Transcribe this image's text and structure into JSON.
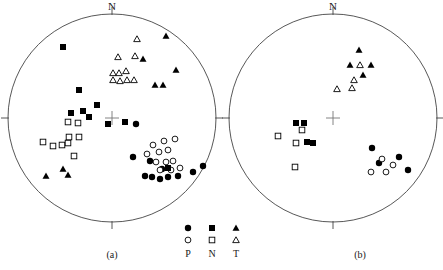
{
  "figure": {
    "background_color": "#ffffff",
    "stroke_color": "#444444",
    "marker_color": "#000000",
    "width": 443,
    "height": 270
  },
  "panels": [
    {
      "id": "a",
      "caption": "(a)",
      "north_label": "N",
      "cx": 112,
      "cy": 118,
      "r": 104
    },
    {
      "id": "b",
      "caption": "(b)",
      "north_label": "N",
      "cx": 333,
      "cy": 118,
      "r": 104
    }
  ],
  "legend": {
    "columns": [
      {
        "key": "P",
        "label": "P",
        "filled_symbol": "filled-circle",
        "open_symbol": "open-circle"
      },
      {
        "key": "N",
        "label": "N",
        "filled_symbol": "filled-square",
        "open_symbol": "open-square"
      },
      {
        "key": "T",
        "label": "T",
        "filled_symbol": "filled-triangle",
        "open_symbol": "open-triangle"
      }
    ]
  },
  "chart_data": {
    "type": "scatter",
    "title": "",
    "subtitle": "",
    "xlabel": "",
    "ylabel": "",
    "grid": false,
    "legend_position": "bottom-center",
    "projection": "lower-hemisphere equal-area stereonet",
    "axis_annotations": [
      "N at top of each net",
      "tick marks at E and W on horizon of each net",
      "cross marker at center of each net"
    ],
    "series": [
      {
        "name": "P (filled circle)",
        "panel": "a",
        "symbol": "filled-circle",
        "points": [
          [
            136,
            124
          ],
          [
            133,
            157
          ],
          [
            150,
            161
          ],
          [
            162,
            169
          ],
          [
            145,
            176
          ],
          [
            152,
            177
          ],
          [
            160,
            179
          ],
          [
            168,
            177
          ],
          [
            178,
            176
          ],
          [
            193,
            172
          ],
          [
            203,
            166
          ]
        ]
      },
      {
        "name": "P (open circle)",
        "panel": "a",
        "symbol": "open-circle",
        "points": [
          [
            153,
            145
          ],
          [
            164,
            141
          ],
          [
            159,
            152
          ],
          [
            168,
            150
          ],
          [
            175,
            139
          ],
          [
            147,
            154
          ],
          [
            156,
            162
          ],
          [
            166,
            162
          ],
          [
            173,
            161
          ],
          [
            160,
            170
          ],
          [
            171,
            170
          ],
          [
            180,
            168
          ]
        ]
      },
      {
        "name": "N (filled square)",
        "panel": "a",
        "symbol": "filled-square",
        "points": [
          [
            63,
            47
          ],
          [
            79,
            90
          ],
          [
            108,
            124
          ],
          [
            125,
            122
          ],
          [
            71,
            113
          ],
          [
            83,
            111
          ],
          [
            89,
            117
          ],
          [
            97,
            105
          ],
          [
            168,
            168
          ]
        ]
      },
      {
        "name": "N (open square)",
        "panel": "a",
        "symbol": "open-square",
        "points": [
          [
            68,
            122
          ],
          [
            78,
            123
          ],
          [
            43,
            142
          ],
          [
            53,
            146
          ],
          [
            62,
            145
          ],
          [
            68,
            143
          ],
          [
            69,
            137
          ],
          [
            79,
            137
          ],
          [
            74,
            156
          ]
        ]
      },
      {
        "name": "T (filled triangle)",
        "panel": "a",
        "symbol": "filled-triangle",
        "points": [
          [
            166,
            36
          ],
          [
            143,
            59
          ],
          [
            176,
            70
          ],
          [
            155,
            85
          ],
          [
            163,
            85
          ],
          [
            46,
            176
          ],
          [
            63,
            169
          ],
          [
            68,
            175
          ]
        ]
      },
      {
        "name": "T (open triangle)",
        "panel": "a",
        "symbol": "open-triangle",
        "points": [
          [
            137,
            39
          ],
          [
            118,
            57
          ],
          [
            135,
            56
          ],
          [
            113,
            73
          ],
          [
            119,
            73
          ],
          [
            126,
            71
          ],
          [
            113,
            80
          ],
          [
            120,
            81
          ],
          [
            127,
            80
          ],
          [
            134,
            80
          ]
        ]
      },
      {
        "name": "P (filled circle)",
        "panel": "b",
        "symbol": "filled-circle",
        "points": [
          [
            372,
            148
          ],
          [
            379,
            163
          ],
          [
            399,
            157
          ],
          [
            408,
            170
          ]
        ]
      },
      {
        "name": "P (open circle)",
        "panel": "b",
        "symbol": "open-circle",
        "points": [
          [
            382,
            159
          ],
          [
            371,
            172
          ],
          [
            386,
            172
          ],
          [
            393,
            165
          ]
        ]
      },
      {
        "name": "N (filled square)",
        "panel": "b",
        "symbol": "filled-square",
        "points": [
          [
            296,
            123
          ],
          [
            304,
            123
          ],
          [
            307,
            142
          ],
          [
            313,
            143
          ]
        ]
      },
      {
        "name": "N (open square)",
        "panel": "b",
        "symbol": "open-square",
        "points": [
          [
            278,
            136
          ],
          [
            302,
            130
          ],
          [
            296,
            143
          ],
          [
            295,
            167
          ]
        ]
      },
      {
        "name": "T (filled triangle)",
        "panel": "b",
        "symbol": "filled-triangle",
        "points": [
          [
            359,
            50
          ],
          [
            350,
            65
          ],
          [
            371,
            65
          ],
          [
            363,
            75
          ]
        ]
      },
      {
        "name": "T (open triangle)",
        "panel": "b",
        "symbol": "open-triangle",
        "points": [
          [
            360,
            65
          ],
          [
            354,
            80
          ],
          [
            352,
            88
          ],
          [
            337,
            89
          ]
        ]
      }
    ]
  }
}
